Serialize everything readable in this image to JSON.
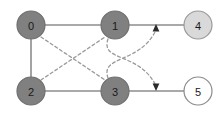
{
  "diagram": {
    "type": "directed-graph",
    "title": "",
    "width": 223,
    "height": 117,
    "background": "#ffffff",
    "colors": {
      "node_dark_fill": "#808080",
      "node_light_fill": "#d9d9d9",
      "node_white_fill": "#ffffff",
      "node_stroke": "#7a7a7a",
      "solid_edge": "#8c8c8c",
      "dashed_edge": "#9a9a9a",
      "label_text": "#1a1a1a"
    },
    "nodes": [
      {
        "id": "0",
        "label": "0",
        "cx": 31,
        "cy": 25,
        "r": 14,
        "fill": "#808080",
        "stroke": "#6f6f6f",
        "style": "dark"
      },
      {
        "id": "1",
        "label": "1",
        "cx": 115,
        "cy": 25,
        "r": 14,
        "fill": "#808080",
        "stroke": "#6f6f6f",
        "style": "dark"
      },
      {
        "id": "4",
        "label": "4",
        "cx": 198,
        "cy": 25,
        "r": 14,
        "fill": "#d9d9d9",
        "stroke": "#9a9a9a",
        "style": "light"
      },
      {
        "id": "2",
        "label": "2",
        "cx": 31,
        "cy": 91,
        "r": 14,
        "fill": "#808080",
        "stroke": "#6f6f6f",
        "style": "dark"
      },
      {
        "id": "3",
        "label": "3",
        "cx": 115,
        "cy": 91,
        "r": 14,
        "fill": "#808080",
        "stroke": "#6f6f6f",
        "style": "dark"
      },
      {
        "id": "5",
        "label": "5",
        "cx": 198,
        "cy": 91,
        "r": 14,
        "fill": "#ffffff",
        "stroke": "#8a8a8a",
        "style": "white"
      }
    ],
    "solid_edges": [
      {
        "name": "edge-0-1",
        "from": "0",
        "to": "1",
        "x1": 45,
        "y1": 25,
        "x2": 101,
        "y2": 25
      },
      {
        "name": "edge-1-4",
        "from": "1",
        "to": "4",
        "x1": 129,
        "y1": 25,
        "x2": 184,
        "y2": 25
      },
      {
        "name": "edge-0-2",
        "from": "0",
        "to": "2",
        "x1": 31,
        "y1": 39,
        "x2": 31,
        "y2": 77
      },
      {
        "name": "edge-2-3",
        "from": "2",
        "to": "3",
        "x1": 45,
        "y1": 91,
        "x2": 101,
        "y2": 91
      },
      {
        "name": "edge-3-5",
        "from": "3",
        "to": "5",
        "x1": 129,
        "y1": 91,
        "x2": 184,
        "y2": 91
      }
    ],
    "dashed_edges": [
      {
        "name": "dashed-edge-0-3",
        "from": "0",
        "to": "3",
        "path": "M 41 37 L 105 80"
      },
      {
        "name": "dashed-edge-2-1",
        "from": "2",
        "to": "1",
        "path": "M 41 80 L 105 37"
      },
      {
        "name": "dashed-edge-1-arrow-down",
        "from": "1",
        "to": "arrowhead-down",
        "path": "M 108 39 C 100 62 140 52 156 86"
      },
      {
        "name": "dashed-edge-3-arrow-up",
        "from": "3",
        "to": "arrowhead-up",
        "path": "M 108 78 C 100 55 140 64 156 30"
      }
    ],
    "arrowheads": [
      {
        "name": "arrowhead-up",
        "x": 156,
        "y": 24,
        "direction": "up",
        "color": "#2b2b2b"
      },
      {
        "name": "arrowhead-down",
        "x": 156,
        "y": 91,
        "direction": "down",
        "color": "#2b2b2b"
      }
    ]
  }
}
